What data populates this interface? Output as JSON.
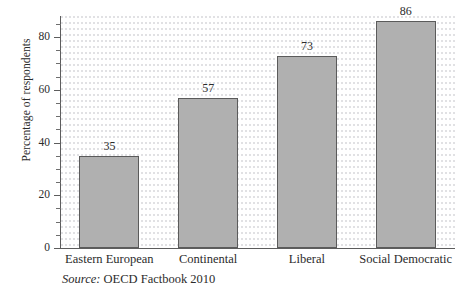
{
  "chart_data": {
    "type": "bar",
    "title": "",
    "subtitle": "",
    "xlabel": "",
    "ylabel": "Percentage of respondents",
    "categories": [
      "Eastern European",
      "Continental",
      "Liberal",
      "Social Democratic"
    ],
    "values": [
      35,
      57,
      73,
      86
    ],
    "value_labels": [
      "35",
      "57",
      "73",
      "86"
    ],
    "ylim": [
      0,
      88
    ],
    "ytick_labels": [
      "0",
      "20",
      "40",
      "60",
      "80"
    ],
    "ytick_values": [
      0,
      20,
      40,
      60,
      80
    ],
    "yminor_step": 5,
    "grid": false,
    "legend": "none",
    "series": [
      {
        "name": "Percentage of respondents",
        "values": [
          35,
          57,
          73,
          86
        ]
      }
    ],
    "bar_fill_color": "#b0b0b0",
    "bar_edge_color": "#5b5b5b",
    "axis_color": "#5d5d5d",
    "text_color": "#2b2b2b"
  },
  "source": {
    "label": "Source",
    "separator": ":",
    "text": "OECD Factbook 2010"
  }
}
